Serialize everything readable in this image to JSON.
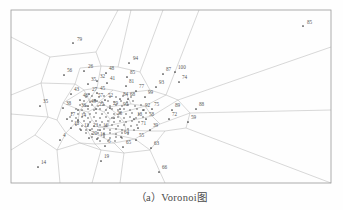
{
  "figure": {
    "caption": "（a）Voronoi图",
    "title": "Voronoi图",
    "panel_letter": "a",
    "frame": {
      "x": 11,
      "y": 10,
      "width": 320,
      "height": 173
    },
    "colors": {
      "background": "#fefefe",
      "frame_line": "#9a9a9a",
      "cell_line": "#b8b8b8",
      "point": "#333333",
      "label_text": "#555555",
      "caption_text": "#4a4a4a"
    }
  },
  "chart_data": {
    "type": "scatter",
    "title": "Voronoi图",
    "xlabel": "",
    "ylabel": "",
    "grid": false,
    "legend": "none",
    "xlim": [
      11,
      331
    ],
    "ylim": [
      10,
      183
    ],
    "note": "Voronoi tessellation of 100 labelled seed points; dense cluster at centre, sparse outliers near the frame edges.",
    "points": [
      {
        "id": "85",
        "x": 303,
        "y": 26,
        "label_dx": 4,
        "label_dy": -2
      },
      {
        "id": "79",
        "x": 73,
        "y": 43,
        "label_dx": 4,
        "label_dy": -2
      },
      {
        "id": "94",
        "x": 129,
        "y": 63,
        "label_dx": 4,
        "label_dy": -3
      },
      {
        "id": "56",
        "x": 64,
        "y": 75,
        "label_dx": 3,
        "label_dy": -3
      },
      {
        "id": "26",
        "x": 84,
        "y": 71,
        "label_dx": 4,
        "label_dy": -3
      },
      {
        "id": "48",
        "x": 106,
        "y": 73,
        "label_dx": 3,
        "label_dy": -3
      },
      {
        "id": "85b",
        "id_text": "85",
        "x": 127,
        "y": 77,
        "label_dx": 3,
        "label_dy": -3
      },
      {
        "id": "87",
        "x": 163,
        "y": 74,
        "label_dx": 3,
        "label_dy": -3
      },
      {
        "id": "100",
        "x": 175,
        "y": 72,
        "label_dx": 3,
        "label_dy": -3
      },
      {
        "id": "74",
        "x": 179,
        "y": 82,
        "label_dx": 3,
        "label_dy": -3
      },
      {
        "id": "35",
        "x": 88,
        "y": 84,
        "label_dx": 3,
        "label_dy": -3
      },
      {
        "id": "32",
        "x": 97,
        "y": 81,
        "label_dx": 3,
        "label_dy": -3
      },
      {
        "id": "41",
        "x": 107,
        "y": 83,
        "label_dx": 3,
        "label_dy": -3
      },
      {
        "id": "81",
        "x": 126,
        "y": 86,
        "label_dx": 3,
        "label_dy": -3
      },
      {
        "id": "93",
        "x": 156,
        "y": 87,
        "label_dx": 3,
        "label_dy": -3
      },
      {
        "id": "77",
        "x": 136,
        "y": 91,
        "label_dx": 3,
        "label_dy": -3
      },
      {
        "id": "43",
        "x": 71,
        "y": 94,
        "label_dx": 3,
        "label_dy": -3
      },
      {
        "id": "27",
        "x": 89,
        "y": 94,
        "label_dx": 3,
        "label_dy": -3
      },
      {
        "id": "45",
        "x": 97,
        "y": 93,
        "label_dx": 3,
        "label_dy": -3
      },
      {
        "id": "99",
        "x": 145,
        "y": 97,
        "label_dx": 3,
        "label_dy": -3
      },
      {
        "id": "46",
        "x": 80,
        "y": 100,
        "label_dx": 3,
        "label_dy": -3
      },
      {
        "id": "57",
        "x": 95,
        "y": 100,
        "label_dx": 3,
        "label_dy": -3
      },
      {
        "id": "52",
        "x": 105,
        "y": 100,
        "label_dx": 3,
        "label_dy": -3
      },
      {
        "id": "84",
        "x": 120,
        "y": 99,
        "label_dx": 3,
        "label_dy": -3
      },
      {
        "id": "68",
        "x": 128,
        "y": 99,
        "label_dx": 2,
        "label_dy": -3
      },
      {
        "id": "35c",
        "id_text": "35",
        "x": 40,
        "y": 106,
        "label_dx": 3,
        "label_dy": -3
      },
      {
        "id": "38",
        "x": 63,
        "y": 108,
        "label_dx": 3,
        "label_dy": -3
      },
      {
        "id": "49",
        "x": 88,
        "y": 106,
        "label_dx": 3,
        "label_dy": -3
      },
      {
        "id": "36",
        "x": 78,
        "y": 110,
        "label_dx": 3,
        "label_dy": -3
      },
      {
        "id": "22",
        "x": 96,
        "y": 109,
        "label_dx": 3,
        "label_dy": -3
      },
      {
        "id": "29",
        "x": 110,
        "y": 108,
        "label_dx": 3,
        "label_dy": -3
      },
      {
        "id": "90",
        "x": 120,
        "y": 109,
        "label_dx": 3,
        "label_dy": -3
      },
      {
        "id": "92",
        "x": 143,
        "y": 110,
        "label_dx": 2,
        "label_dy": -3
      },
      {
        "id": "75",
        "x": 152,
        "y": 109,
        "label_dx": 2,
        "label_dy": -3
      },
      {
        "id": "89",
        "x": 172,
        "y": 110,
        "label_dx": 3,
        "label_dy": -3
      },
      {
        "id": "88",
        "x": 196,
        "y": 109,
        "label_dx": 3,
        "label_dy": -3
      },
      {
        "id": "17",
        "x": 67,
        "y": 119,
        "label_dx": 3,
        "label_dy": -3
      },
      {
        "id": "14",
        "x": 78,
        "y": 120,
        "label_dx": 3,
        "label_dy": -3
      },
      {
        "id": "28",
        "x": 114,
        "y": 118,
        "label_dx": 3,
        "label_dy": -3
      },
      {
        "id": "18",
        "x": 134,
        "y": 119,
        "label_dx": 3,
        "label_dy": -3
      },
      {
        "id": "58",
        "x": 146,
        "y": 119,
        "label_dx": 3,
        "label_dy": -3
      },
      {
        "id": "72",
        "x": 169,
        "y": 119,
        "label_dx": 3,
        "label_dy": -3
      },
      {
        "id": "59",
        "x": 188,
        "y": 122,
        "label_dx": 3,
        "label_dy": -3
      },
      {
        "id": "10",
        "x": 71,
        "y": 128,
        "label_dx": 3,
        "label_dy": -3
      },
      {
        "id": "12",
        "x": 81,
        "y": 130,
        "label_dx": 3,
        "label_dy": -3
      },
      {
        "id": "23",
        "x": 90,
        "y": 130,
        "label_dx": 3,
        "label_dy": -3
      },
      {
        "id": "16b",
        "id_text": "16",
        "x": 100,
        "y": 130,
        "label_dx": 3,
        "label_dy": -3
      },
      {
        "id": "71",
        "x": 138,
        "y": 128,
        "label_dx": 3,
        "label_dy": -3
      },
      {
        "id": "39",
        "x": 150,
        "y": 130,
        "label_dx": 3,
        "label_dy": -3
      },
      {
        "id": "4",
        "x": 60,
        "y": 140,
        "label_dx": 3,
        "label_dy": -3
      },
      {
        "id": "20",
        "x": 89,
        "y": 138,
        "label_dx": 3,
        "label_dy": -3
      },
      {
        "id": "16",
        "x": 97,
        "y": 139,
        "label_dx": 3,
        "label_dy": -3
      },
      {
        "id": "64",
        "x": 121,
        "y": 137,
        "label_dx": 3,
        "label_dy": -3
      },
      {
        "id": "55",
        "x": 136,
        "y": 140,
        "label_dx": 3,
        "label_dy": -3
      },
      {
        "id": "5",
        "x": 105,
        "y": 146,
        "label_dx": 3,
        "label_dy": -3
      },
      {
        "id": "65",
        "x": 123,
        "y": 147,
        "label_dx": 3,
        "label_dy": -3
      },
      {
        "id": "63",
        "x": 151,
        "y": 148,
        "label_dx": 3,
        "label_dy": -3
      },
      {
        "id": "19",
        "x": 101,
        "y": 161,
        "label_dx": 3,
        "label_dy": -3
      },
      {
        "id": "14b",
        "id_text": "14",
        "x": 38,
        "y": 167,
        "label_dx": 3,
        "label_dy": -3
      },
      {
        "id": "66",
        "x": 159,
        "y": 172,
        "label_dx": 3,
        "label_dy": -3
      }
    ],
    "cluster_points": [
      [
        86,
        97
      ],
      [
        92,
        96
      ],
      [
        99,
        97
      ],
      [
        104,
        96
      ],
      [
        110,
        97
      ],
      [
        116,
        97
      ],
      [
        123,
        96
      ],
      [
        131,
        97
      ],
      [
        84,
        101
      ],
      [
        90,
        102
      ],
      [
        97,
        101
      ],
      [
        102,
        102
      ],
      [
        108,
        101
      ],
      [
        114,
        102
      ],
      [
        121,
        101
      ],
      [
        127,
        102
      ],
      [
        133,
        101
      ],
      [
        80,
        105
      ],
      [
        86,
        106
      ],
      [
        92,
        105
      ],
      [
        98,
        106
      ],
      [
        104,
        105
      ],
      [
        110,
        106
      ],
      [
        116,
        105
      ],
      [
        122,
        106
      ],
      [
        128,
        105
      ],
      [
        135,
        106
      ],
      [
        141,
        105
      ],
      [
        76,
        109
      ],
      [
        82,
        110
      ],
      [
        88,
        109
      ],
      [
        94,
        110
      ],
      [
        100,
        109
      ],
      [
        106,
        110
      ],
      [
        112,
        109
      ],
      [
        118,
        110
      ],
      [
        124,
        109
      ],
      [
        130,
        110
      ],
      [
        137,
        109
      ],
      [
        144,
        110
      ],
      [
        72,
        113
      ],
      [
        78,
        114
      ],
      [
        84,
        113
      ],
      [
        90,
        114
      ],
      [
        96,
        113
      ],
      [
        102,
        114
      ],
      [
        108,
        113
      ],
      [
        114,
        114
      ],
      [
        120,
        113
      ],
      [
        126,
        114
      ],
      [
        132,
        113
      ],
      [
        139,
        114
      ],
      [
        146,
        113
      ],
      [
        70,
        117
      ],
      [
        76,
        118
      ],
      [
        82,
        117
      ],
      [
        88,
        118
      ],
      [
        94,
        117
      ],
      [
        100,
        118
      ],
      [
        106,
        117
      ],
      [
        112,
        118
      ],
      [
        118,
        117
      ],
      [
        124,
        118
      ],
      [
        130,
        117
      ],
      [
        136,
        118
      ],
      [
        143,
        117
      ],
      [
        72,
        121
      ],
      [
        78,
        122
      ],
      [
        84,
        121
      ],
      [
        90,
        122
      ],
      [
        96,
        121
      ],
      [
        102,
        122
      ],
      [
        108,
        121
      ],
      [
        114,
        122
      ],
      [
        120,
        121
      ],
      [
        126,
        122
      ],
      [
        132,
        121
      ],
      [
        139,
        122
      ],
      [
        76,
        125
      ],
      [
        82,
        126
      ],
      [
        88,
        125
      ],
      [
        94,
        126
      ],
      [
        100,
        125
      ],
      [
        106,
        126
      ],
      [
        112,
        125
      ],
      [
        118,
        126
      ],
      [
        124,
        125
      ],
      [
        131,
        126
      ],
      [
        137,
        125
      ],
      [
        80,
        129
      ],
      [
        86,
        130
      ],
      [
        92,
        129
      ],
      [
        98,
        130
      ],
      [
        104,
        129
      ],
      [
        110,
        130
      ],
      [
        116,
        129
      ],
      [
        122,
        130
      ],
      [
        128,
        129
      ],
      [
        134,
        130
      ],
      [
        86,
        133
      ],
      [
        92,
        134
      ],
      [
        98,
        133
      ],
      [
        104,
        134
      ],
      [
        110,
        133
      ],
      [
        116,
        134
      ],
      [
        122,
        133
      ],
      [
        128,
        134
      ],
      [
        92,
        137
      ],
      [
        98,
        138
      ],
      [
        104,
        137
      ],
      [
        110,
        138
      ],
      [
        116,
        137
      ],
      [
        122,
        138
      ],
      [
        100,
        141
      ],
      [
        108,
        141
      ],
      [
        115,
        141
      ]
    ],
    "cell_edges": [
      [
        11,
        37,
        50,
        57
      ],
      [
        50,
        57,
        96,
        52
      ],
      [
        96,
        52,
        118,
        10
      ],
      [
        50,
        57,
        41,
        83
      ],
      [
        41,
        83,
        11,
        95
      ],
      [
        96,
        52,
        101,
        66
      ],
      [
        101,
        66,
        118,
        67
      ],
      [
        118,
        67,
        131,
        10
      ],
      [
        101,
        66,
        80,
        68
      ],
      [
        80,
        68,
        75,
        84
      ],
      [
        75,
        84,
        41,
        83
      ],
      [
        118,
        67,
        140,
        72
      ],
      [
        140,
        72,
        163,
        10
      ],
      [
        140,
        72,
        150,
        90
      ],
      [
        150,
        90,
        166,
        95
      ],
      [
        166,
        95,
        199,
        10
      ],
      [
        166,
        95,
        178,
        100
      ],
      [
        178,
        100,
        331,
        47
      ],
      [
        178,
        100,
        190,
        113
      ],
      [
        190,
        113,
        331,
        110
      ],
      [
        190,
        113,
        186,
        128
      ],
      [
        186,
        128,
        331,
        183
      ],
      [
        186,
        128,
        165,
        131
      ],
      [
        165,
        131,
        150,
        150
      ],
      [
        150,
        150,
        165,
        183
      ],
      [
        150,
        150,
        124,
        153
      ],
      [
        124,
        153,
        120,
        183
      ],
      [
        124,
        153,
        101,
        150
      ],
      [
        101,
        150,
        92,
        183
      ],
      [
        101,
        150,
        80,
        143
      ],
      [
        80,
        143,
        57,
        150
      ],
      [
        57,
        150,
        60,
        183
      ],
      [
        57,
        150,
        35,
        135
      ],
      [
        35,
        135,
        11,
        150
      ],
      [
        35,
        135,
        48,
        117
      ],
      [
        48,
        117,
        11,
        114
      ],
      [
        48,
        117,
        41,
        83
      ],
      [
        75,
        84,
        84,
        90
      ],
      [
        84,
        90,
        97,
        88
      ],
      [
        97,
        88,
        101,
        66
      ],
      [
        97,
        88,
        113,
        90
      ],
      [
        113,
        90,
        126,
        93
      ],
      [
        126,
        93,
        150,
        90
      ],
      [
        126,
        93,
        131,
        104
      ],
      [
        131,
        104,
        145,
        106
      ],
      [
        145,
        106,
        166,
        95
      ],
      [
        145,
        106,
        152,
        116
      ],
      [
        152,
        116,
        178,
        100
      ],
      [
        152,
        116,
        160,
        124
      ],
      [
        160,
        124,
        190,
        113
      ],
      [
        160,
        124,
        148,
        131
      ],
      [
        148,
        131,
        165,
        131
      ],
      [
        148,
        131,
        135,
        139
      ],
      [
        135,
        139,
        150,
        150
      ],
      [
        135,
        139,
        114,
        143
      ],
      [
        114,
        143,
        124,
        153
      ],
      [
        114,
        143,
        95,
        144
      ],
      [
        95,
        144,
        101,
        150
      ],
      [
        95,
        144,
        80,
        143
      ],
      [
        80,
        143,
        66,
        133
      ],
      [
        66,
        133,
        57,
        150
      ],
      [
        66,
        133,
        57,
        120
      ],
      [
        57,
        120,
        48,
        117
      ],
      [
        57,
        120,
        63,
        103
      ],
      [
        63,
        103,
        75,
        84
      ],
      [
        63,
        103,
        84,
        90
      ],
      [
        84,
        90,
        89,
        100
      ],
      [
        89,
        100,
        97,
        88
      ],
      [
        89,
        100,
        99,
        102
      ],
      [
        99,
        102,
        113,
        90
      ],
      [
        99,
        102,
        108,
        107
      ],
      [
        108,
        107,
        131,
        104
      ],
      [
        108,
        107,
        117,
        114
      ],
      [
        117,
        114,
        145,
        106
      ],
      [
        117,
        114,
        124,
        122
      ],
      [
        124,
        122,
        152,
        116
      ],
      [
        124,
        122,
        126,
        130
      ],
      [
        126,
        130,
        148,
        131
      ],
      [
        126,
        130,
        112,
        134
      ],
      [
        112,
        134,
        135,
        139
      ],
      [
        112,
        134,
        98,
        135
      ],
      [
        98,
        135,
        114,
        143
      ],
      [
        98,
        135,
        86,
        128
      ],
      [
        86,
        128,
        95,
        144
      ],
      [
        86,
        128,
        78,
        120
      ],
      [
        78,
        120,
        66,
        133
      ],
      [
        78,
        120,
        80,
        110
      ],
      [
        80,
        110,
        63,
        103
      ],
      [
        80,
        110,
        89,
        100
      ],
      [
        89,
        100,
        95,
        108
      ],
      [
        95,
        108,
        99,
        102
      ],
      [
        95,
        108,
        104,
        112
      ],
      [
        104,
        112,
        108,
        107
      ],
      [
        104,
        112,
        110,
        119
      ],
      [
        110,
        119,
        117,
        114
      ],
      [
        110,
        119,
        108,
        126
      ],
      [
        108,
        126,
        124,
        122
      ],
      [
        108,
        126,
        98,
        127
      ],
      [
        98,
        127,
        126,
        130
      ],
      [
        98,
        127,
        92,
        120
      ],
      [
        92,
        120,
        86,
        128
      ],
      [
        92,
        120,
        88,
        112
      ],
      [
        88,
        112,
        80,
        110
      ],
      [
        88,
        112,
        95,
        108
      ]
    ]
  }
}
